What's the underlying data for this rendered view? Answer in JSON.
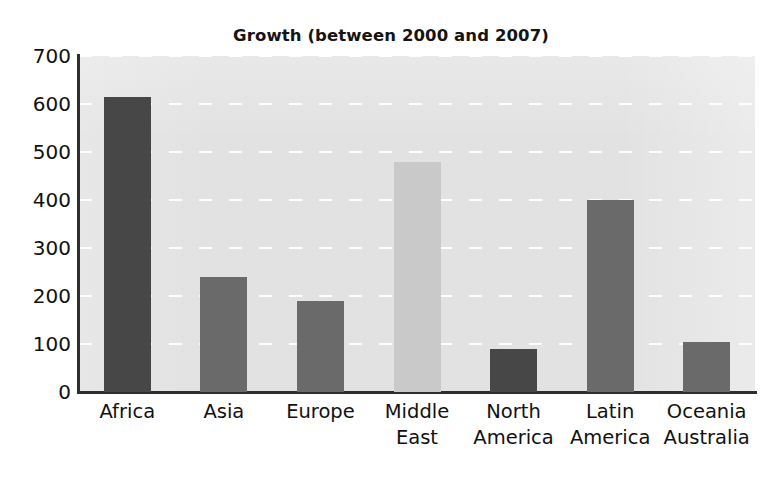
{
  "chart_data": {
    "type": "bar",
    "title": "Growth (between 2000 and 2007)",
    "xlabel": "",
    "ylabel": "",
    "categories": [
      "Africa",
      "Asia",
      "Europe",
      "Middle\nEast",
      "North\nAmerica",
      "Latin\nAmerica",
      "Oceania\nAustralia"
    ],
    "values": [
      615,
      240,
      190,
      480,
      90,
      400,
      105
    ],
    "bar_colors": [
      "#474747",
      "#6a6a6a",
      "#6a6a6a",
      "#c9c9c9",
      "#474747",
      "#6a6a6a",
      "#6a6a6a"
    ],
    "ylim": [
      0,
      700
    ],
    "ytick_step": 100,
    "ytick_labels": [
      "0",
      "100",
      "200",
      "300",
      "400",
      "500",
      "600",
      "700"
    ],
    "ytick_values": [
      0,
      100,
      200,
      300,
      400,
      500,
      600,
      700
    ],
    "grid": true,
    "grid_axis": "y",
    "grid_style": "dashed-white",
    "legend": null,
    "plot_background": "#e2e2e2",
    "axis_color": "#2e2e2e",
    "text_color": "#111111"
  }
}
